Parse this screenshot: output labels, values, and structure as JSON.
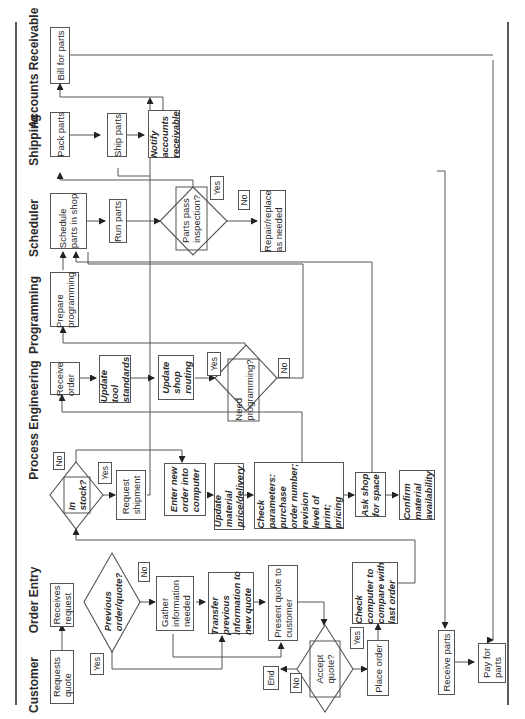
{
  "diagram": {
    "type": "swimlane-flowchart",
    "orientation": "rotated-90-ccw",
    "lanes": [
      {
        "id": "customer",
        "label": "Customer"
      },
      {
        "id": "order_entry",
        "label": "Order Entry"
      },
      {
        "id": "process_engineering",
        "label": "Process Engineering"
      },
      {
        "id": "programming",
        "label": "Programming"
      },
      {
        "id": "scheduler",
        "label": "Scheduler"
      },
      {
        "id": "shipping",
        "label": "Shipping"
      },
      {
        "id": "accounts_receivable",
        "label": "Accounts Receivable"
      }
    ],
    "nodes": {
      "requests_quote": "Requests\nquote",
      "receives_request": "Receives\nrequest",
      "previous_order_quote": "Previous\norder/quote?",
      "gather_information": "Gather\ninformation\nneeded",
      "transfer_previous": "Transfer\nprevious\ninformation to\nnew quote",
      "present_quote": "Present quote to\ncustomer",
      "accept_quote": "Accept\nquote?",
      "end": "End",
      "place_order": "Place order",
      "check_computer": "Check\ncomputer to\ncompare with\nlast order",
      "in_stock": "In\nstock?",
      "request_shipment": "Request\nshipment",
      "enter_new_order": "Enter new\norder into\ncomputer",
      "update_material": "Update\nmaterial\nprice/delivery",
      "check_parameters": "Check\nparameters:\npurchase\norder number;\nrevision\nlevel of\nprint;\npricing",
      "ask_shop": "Ask shop\nfor space",
      "confirm_material": "Confirm\nmaterial\navailability",
      "receive_order": "Receive\norder",
      "update_tool": "Update\ntool\nstandards",
      "update_shop_routing": "Update\nshop\nrouting",
      "need_programming": "Need\nprogramming?",
      "prepare_programming": "Prepare\nprogramming",
      "schedule_parts": "Schedule\nparts in shop",
      "run_parts": "Run parts",
      "parts_pass": "Parts pass\ninspection?",
      "repair_replace": "Repair/replace\nas needed",
      "pack_parts": "Pack parts",
      "ship_parts": "Ship parts",
      "notify_ar": "Notify\naccounts\nreceivable",
      "bill_for_parts": "Bill for parts",
      "receive_parts": "Receive parts",
      "pay_for_parts": "Pay for\nparts"
    },
    "branch_labels": {
      "yes": "Yes",
      "no": "No"
    }
  }
}
